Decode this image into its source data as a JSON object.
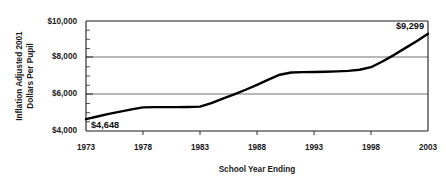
{
  "chart_data": {
    "type": "line",
    "title": "",
    "xlabel": "School Year Ending",
    "ylabel": "Inflation Adjusted 2001 Dollars Per Pupil",
    "ylabel_line1": "Inflation Adjusted 2001",
    "ylabel_line2": "Dollars Per Pupil",
    "xlim": [
      1973,
      2003
    ],
    "ylim": [
      4000,
      10000
    ],
    "grid": true,
    "legend": "none",
    "x_tick_labels": [
      "1973",
      "1978",
      "1983",
      "1988",
      "1993",
      "1998",
      "2003"
    ],
    "x_ticks": [
      1973,
      1978,
      1983,
      1988,
      1993,
      1998,
      2003
    ],
    "y_tick_labels": [
      "$4,000",
      "$6,000",
      "$8,000",
      "$10,000"
    ],
    "y_ticks": [
      4000,
      6000,
      8000,
      10000
    ],
    "y_minor_step": 500,
    "series_name": "Inflation adjusted spending per pupil",
    "x": [
      1973,
      1974,
      1975,
      1976,
      1977,
      1978,
      1979,
      1980,
      1981,
      1982,
      1983,
      1984,
      1985,
      1986,
      1987,
      1988,
      1989,
      1990,
      1991,
      1992,
      1993,
      1994,
      1995,
      1996,
      1997,
      1998,
      1999,
      2000,
      2001,
      2002,
      2003
    ],
    "values": [
      4648,
      4790,
      4930,
      5060,
      5180,
      5290,
      5300,
      5300,
      5300,
      5310,
      5330,
      5520,
      5760,
      6000,
      6250,
      6520,
      6800,
      7070,
      7190,
      7210,
      7220,
      7230,
      7250,
      7280,
      7340,
      7480,
      7790,
      8140,
      8520,
      8900,
      9299
    ],
    "annotations": [
      {
        "label": "$4,648",
        "x": 1973,
        "y": 4648,
        "position": "right-above"
      },
      {
        "label": "$9,299",
        "x": 2003,
        "y": 9299,
        "position": "left-above"
      }
    ]
  }
}
